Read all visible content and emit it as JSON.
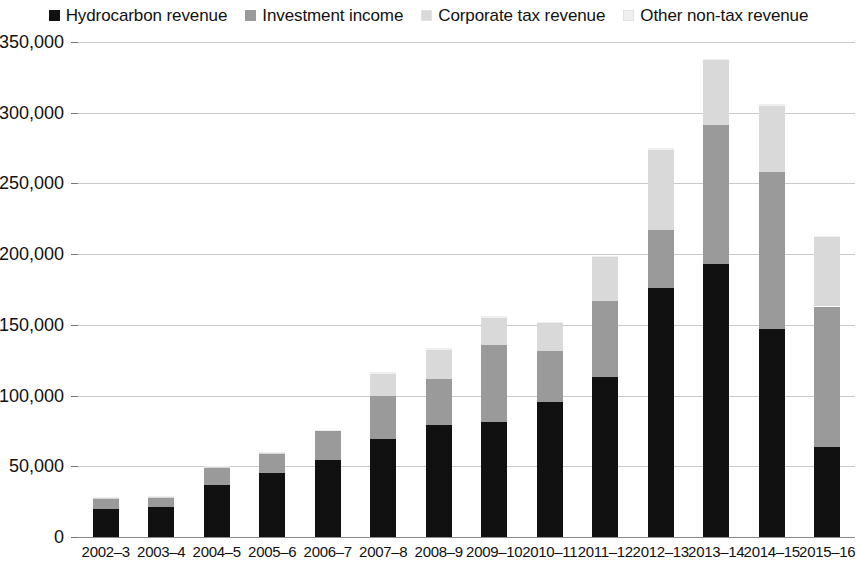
{
  "legend": {
    "position": "top-center",
    "items": [
      {
        "label": "Hydrocarbon revenue",
        "color": "#111111",
        "icon": "square-swatch-icon"
      },
      {
        "label": "Investment income",
        "color": "#9a9a9a",
        "icon": "square-swatch-icon"
      },
      {
        "label": "Corporate tax revenue",
        "color": "#d9d9d9",
        "icon": "square-swatch-icon"
      },
      {
        "label": "Other non-tax revenue",
        "color": "#efefef",
        "icon": "square-swatch-icon"
      }
    ]
  },
  "y_axis": {
    "ticks": [
      "0",
      "50,000",
      "100,000",
      "150,000",
      "200,000",
      "250,000",
      "300,000",
      "350,000"
    ],
    "min": 0,
    "max": 350000,
    "step": 50000
  },
  "x_axis": {
    "ticks": [
      "2002–3",
      "2003–4",
      "2004–5",
      "2005–6",
      "2006–7",
      "2007–8",
      "2008–9",
      "2009–10",
      "2010–11",
      "2011–12",
      "2012–13",
      "2013–14",
      "2014–15",
      "2015–16"
    ]
  },
  "chart_data": {
    "type": "bar",
    "stacked": true,
    "title": "",
    "subtitle": "",
    "xlabel": "",
    "ylabel": "",
    "ylim": [
      0,
      350000
    ],
    "ytick_step": 50000,
    "grid": true,
    "legend_position": "top-center",
    "categories": [
      "2002–3",
      "2003–4",
      "2004–5",
      "2005–6",
      "2006–7",
      "2007–8",
      "2008–9",
      "2009–10",
      "2010–11",
      "2011–12",
      "2012–13",
      "2013–14",
      "2014–15",
      "2015–16"
    ],
    "series": [
      {
        "name": "Hydrocarbon revenue",
        "color": "#111111",
        "values": [
          19500,
          21500,
          36500,
          45500,
          54500,
          69000,
          79000,
          81500,
          95500,
          113000,
          176000,
          193000,
          147000,
          64000
        ]
      },
      {
        "name": "Investment income",
        "color": "#9a9a9a",
        "values": [
          7500,
          6500,
          12000,
          13500,
          20500,
          31000,
          32500,
          54500,
          36000,
          54000,
          41000,
          98000,
          111000,
          99000
        ]
      },
      {
        "name": "Corporate tax revenue",
        "color": "#d9d9d9",
        "values": [
          600,
          600,
          1000,
          500,
          600,
          15000,
          20500,
          19000,
          19500,
          31000,
          57000,
          46000,
          47000,
          49000
        ]
      },
      {
        "name": "Other non-tax revenue",
        "color": "#efefef",
        "values": [
          400,
          400,
          500,
          500,
          400,
          2000,
          2000,
          1000,
          1000,
          1000,
          1000,
          1000,
          1000,
          1000
        ]
      }
    ],
    "totals": [
      28000,
      29000,
      50000,
      60000,
      76000,
      117000,
      134000,
      156000,
      152000,
      199000,
      275000,
      338000,
      306000,
      213000
    ]
  }
}
